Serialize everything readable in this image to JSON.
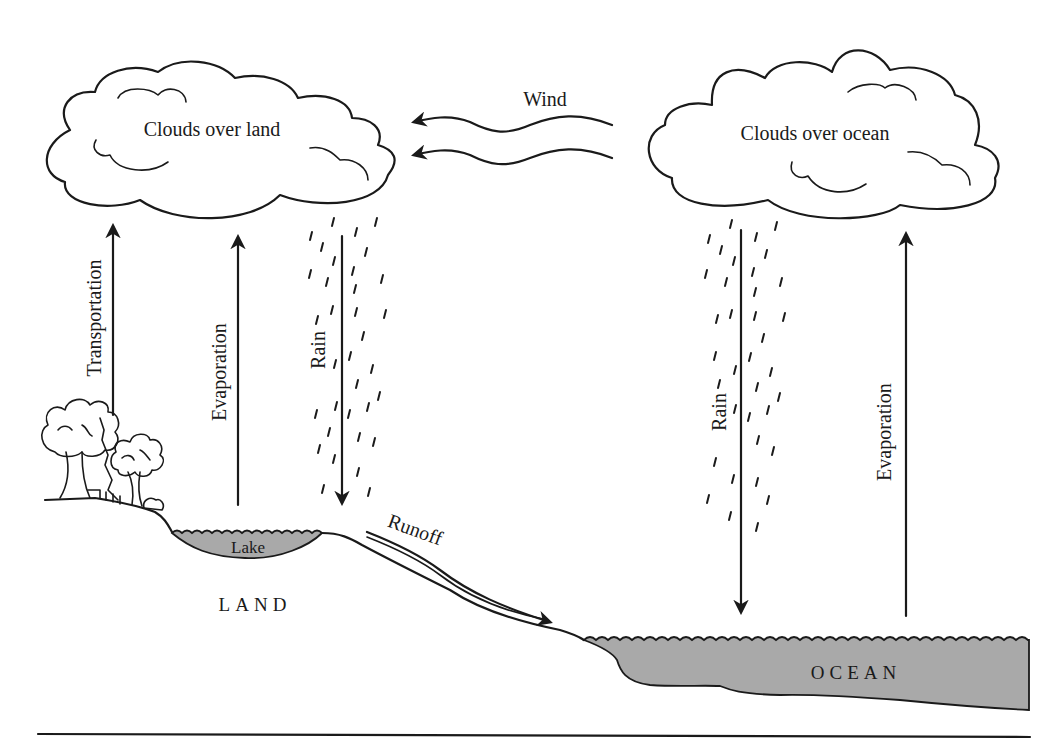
{
  "diagram": {
    "clouds": {
      "land": {
        "label": "Clouds over land"
      },
      "ocean": {
        "label": "Clouds over ocean"
      }
    },
    "wind": {
      "label": "Wind",
      "direction": "ocean-to-land"
    },
    "arrows": {
      "transportation": {
        "label": "Transportation",
        "direction": "up"
      },
      "evaporation_land": {
        "label": "Evaporation",
        "direction": "up"
      },
      "rain_land": {
        "label": "Rain",
        "direction": "down"
      },
      "rain_ocean": {
        "label": "Rain",
        "direction": "down"
      },
      "evaporation_ocean": {
        "label": "Evaporation",
        "direction": "up"
      },
      "runoff": {
        "label": "Runoff",
        "direction": "downhill-to-ocean"
      }
    },
    "regions": {
      "lake": {
        "label": "Lake"
      },
      "land": {
        "label": "LAND"
      },
      "ocean": {
        "label": "OCEAN"
      }
    },
    "colors": {
      "line": "#1a1a1a",
      "water_fill": "#a9a9a9",
      "background": "#ffffff"
    }
  }
}
